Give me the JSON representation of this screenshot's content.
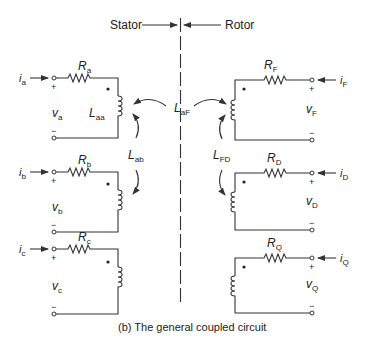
{
  "header": {
    "stator_label": "Stator",
    "rotor_label": "Rotor"
  },
  "caption": "(b) The general coupled circuit",
  "stator": {
    "circuits": [
      {
        "current": "i",
        "current_sub": "a",
        "resistor": "R",
        "resistor_sub": "a",
        "voltage": "v",
        "voltage_sub": "a",
        "inductor": "L",
        "inductor_sub": "aa",
        "plus": "+",
        "minus": "−"
      },
      {
        "current": "i",
        "current_sub": "b",
        "resistor": "R",
        "resistor_sub": "b",
        "voltage": "v",
        "voltage_sub": "b",
        "plus": "+",
        "minus": "−"
      },
      {
        "current": "i",
        "current_sub": "c",
        "resistor": "R",
        "resistor_sub": "c",
        "voltage": "v",
        "voltage_sub": "c",
        "plus": "+",
        "minus": "−"
      }
    ]
  },
  "rotor": {
    "circuits": [
      {
        "current": "i",
        "current_sub": "F",
        "resistor": "R",
        "resistor_sub": "F",
        "voltage": "v",
        "voltage_sub": "F",
        "plus": "+",
        "minus": "−"
      },
      {
        "current": "i",
        "current_sub": "D",
        "resistor": "R",
        "resistor_sub": "D",
        "voltage": "v",
        "voltage_sub": "D",
        "plus": "+",
        "minus": "−"
      },
      {
        "current": "i",
        "current_sub": "Q",
        "resistor": "R",
        "resistor_sub": "Q",
        "voltage": "v",
        "voltage_sub": "Q",
        "plus": "+",
        "minus": "−"
      }
    ]
  },
  "mutual": {
    "laf": {
      "main": "L",
      "sub": "aF"
    },
    "lab": {
      "main": "L",
      "sub": "ab"
    },
    "lfd": {
      "main": "L",
      "sub": "FD"
    }
  },
  "colors": {
    "line": "#333333",
    "text": "#222222",
    "background": "#ffffff"
  }
}
